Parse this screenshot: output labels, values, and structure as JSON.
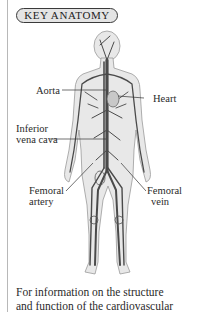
{
  "badge": {
    "label": "KEY ANATOMY"
  },
  "figure": {
    "labels": {
      "aorta": "Aorta",
      "heart": "Heart",
      "inferior_vena_cava_1": "Inferior",
      "inferior_vena_cava_2": "vena cava",
      "femoral_artery_1": "Femoral",
      "femoral_artery_2": "artery",
      "femoral_vein_1": "Femoral",
      "femoral_vein_2": "vein"
    }
  },
  "caption": {
    "line1": "For information on the structure",
    "line2": "and function of the cardiovascular"
  },
  "colors": {
    "vessel": "#4a4a4a",
    "body_fill": "#e6e6e6",
    "badge_fill": "#e4e4e4"
  }
}
